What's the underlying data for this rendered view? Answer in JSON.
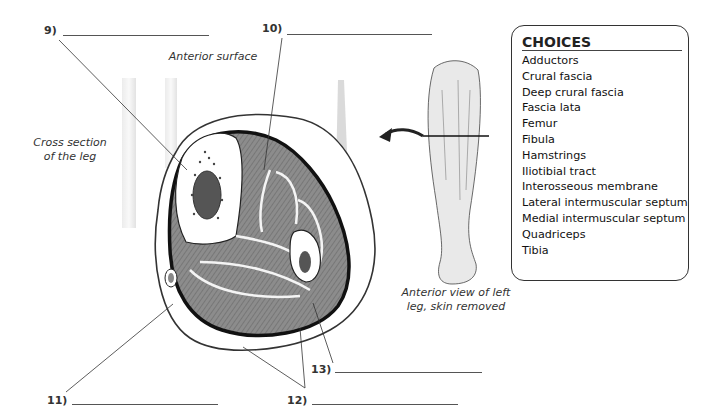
{
  "diagram": {
    "title_labels": {
      "anterior_surface": "Anterior surface",
      "cross_section": [
        "Cross section",
        "of the leg"
      ],
      "anterior_view": [
        "Anterior view of left",
        "leg, skin removed"
      ]
    },
    "blanks": [
      {
        "number": "9)",
        "value": ""
      },
      {
        "number": "10)",
        "value": ""
      },
      {
        "number": "11)",
        "value": ""
      },
      {
        "number": "12)",
        "value": ""
      },
      {
        "number": "13)",
        "value": ""
      }
    ],
    "choices": {
      "title": "CHOICES",
      "items": [
        "Adductors",
        "Crural fascia",
        "Deep crural fascia",
        "Fascia lata",
        "Femur",
        "Fibula",
        "Hamstrings",
        "Iliotibial tract",
        "Interosseous membrane",
        "Lateral intermuscular septum",
        "Medial intermuscular septum",
        "Quadriceps",
        "Tibia"
      ]
    },
    "colors": {
      "muscle": "#8a8a8a",
      "bone": "#ffffff",
      "outline": "#1a1a1a",
      "line": "#444444"
    }
  }
}
